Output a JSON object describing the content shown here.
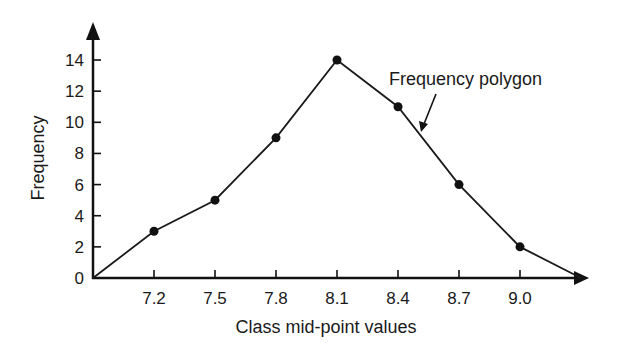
{
  "chart_data": {
    "type": "line",
    "title": "",
    "xlabel": "Class mid-point values",
    "ylabel": "Frequency",
    "categories": [
      "7.2",
      "7.5",
      "7.8",
      "8.1",
      "8.4",
      "8.7",
      "9.0"
    ],
    "series": [
      {
        "name": "Frequency polygon",
        "x": [
          6.9,
          7.2,
          7.5,
          7.8,
          8.1,
          8.4,
          8.7,
          9.0,
          9.3
        ],
        "values": [
          0,
          3,
          5,
          9,
          14,
          11,
          6,
          2,
          0
        ],
        "markers": [
          false,
          true,
          true,
          true,
          true,
          true,
          true,
          true,
          false
        ]
      }
    ],
    "x_ticks": [
      "7.2",
      "7.5",
      "7.8",
      "8.1",
      "8.4",
      "8.7",
      "9.0"
    ],
    "y_ticks": [
      "0",
      "2",
      "4",
      "6",
      "8",
      "10",
      "12",
      "14"
    ],
    "ylim": [
      0,
      15
    ],
    "xlim": [
      6.9,
      9.4
    ],
    "grid": false,
    "legend": null,
    "annotations": [
      {
        "text": "Frequency polygon",
        "arrow_to": "segment between 8.4 and 8.7"
      }
    ],
    "colors": {
      "line": "#1a1a1a",
      "marker": "#111111",
      "axis": "#111111"
    }
  }
}
